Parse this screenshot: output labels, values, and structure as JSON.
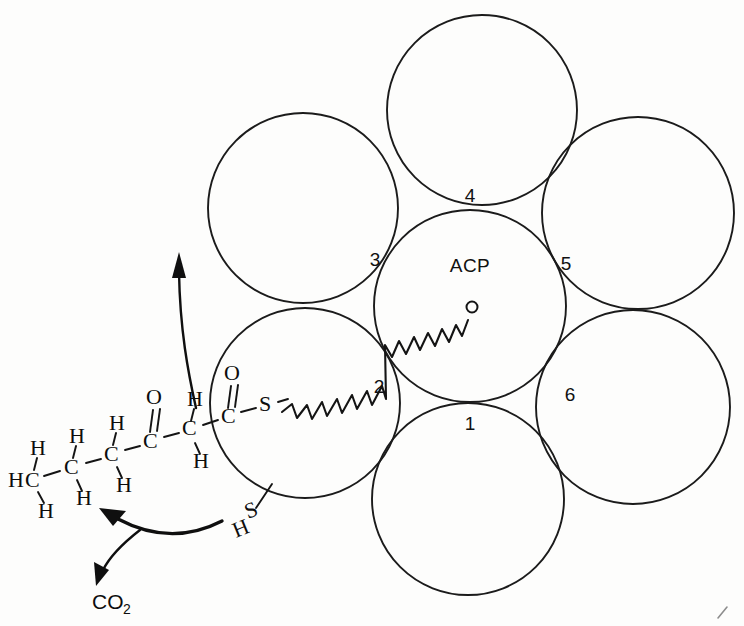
{
  "figure": {
    "background_color": "#fdfdfc",
    "ink_color": "#141414"
  },
  "complex": {
    "center_label": "ACP",
    "center": {
      "cx": 470,
      "cy": 306,
      "r": 96
    },
    "subunits": [
      {
        "id": "subunit-top",
        "cx": 482,
        "cy": 110,
        "r": 95
      },
      {
        "id": "subunit-upper-left",
        "cx": 303,
        "cy": 208,
        "r": 95
      },
      {
        "id": "subunit-upper-right",
        "cx": 638,
        "cy": 213,
        "r": 96
      },
      {
        "id": "subunit-lower-left",
        "cx": 305,
        "cy": 403,
        "r": 95
      },
      {
        "id": "subunit-lower-right",
        "cx": 633,
        "cy": 407,
        "r": 97
      },
      {
        "id": "subunit-bottom",
        "cx": 468,
        "cy": 499,
        "r": 96
      }
    ],
    "site_numbers": [
      {
        "label": "1",
        "x": 470,
        "y": 422
      },
      {
        "label": "2",
        "x": 379,
        "y": 385
      },
      {
        "label": "3",
        "x": 375,
        "y": 259
      },
      {
        "label": "4",
        "x": 470,
        "y": 202
      },
      {
        "label": "5",
        "x": 566,
        "y": 263
      },
      {
        "label": "6",
        "x": 570,
        "y": 394
      }
    ]
  },
  "phosphopantetheine_arm": {
    "description": "zigzag swinging arm from thioester sulfur across site 2 into the ACP core",
    "start_label": "S",
    "terminus_marker": "open-circle",
    "terminus": {
      "cx": 472,
      "cy": 307,
      "r": 5
    }
  },
  "thiol_group": {
    "sulfur": "S",
    "hydrogen": "H"
  },
  "substrate": {
    "name": "3-oxohexanoyl-S-ACP chain",
    "atoms": [
      {
        "text": "H",
        "x": 14,
        "y": 482
      },
      {
        "text": "C",
        "x": 30,
        "y": 482
      },
      {
        "text": "H",
        "x": 31,
        "y": 450
      },
      {
        "text": "H",
        "x": 40,
        "y": 512
      },
      {
        "text": "C",
        "x": 72,
        "y": 470
      },
      {
        "text": "H",
        "x": 70,
        "y": 440
      },
      {
        "text": "H",
        "x": 78,
        "y": 498
      },
      {
        "text": "C",
        "x": 112,
        "y": 457
      },
      {
        "text": "H",
        "x": 110,
        "y": 427
      },
      {
        "text": "H",
        "x": 119,
        "y": 486
      },
      {
        "text": "C",
        "x": 151,
        "y": 444
      },
      {
        "text": "O",
        "x": 146,
        "y": 392
      },
      {
        "text": "C",
        "x": 190,
        "y": 432
      },
      {
        "text": "H",
        "x": 186,
        "y": 404
      },
      {
        "text": "H",
        "x": 195,
        "y": 461
      },
      {
        "text": "C",
        "x": 228,
        "y": 419
      },
      {
        "text": "O",
        "x": 224,
        "y": 368
      },
      {
        "text": "S",
        "x": 266,
        "y": 407
      }
    ]
  },
  "byproduct": {
    "label": "CO",
    "subscript": "2"
  },
  "arrows": {
    "release_arrow": "curved arrow pointing up-left away from the thioester",
    "co2_arrow": "branched curved arrow releasing carbon dioxide"
  }
}
